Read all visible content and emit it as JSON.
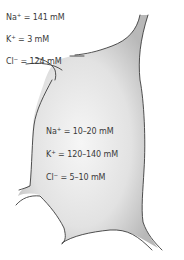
{
  "figure": {
    "extracellular": [
      {
        "ion": "Na",
        "charge": "+",
        "value": " = 141 mM"
      },
      {
        "ion": "K",
        "charge": "+",
        "value": " = 3 mM"
      },
      {
        "ion": "Cl",
        "charge": "−",
        "value": " = 124 mM"
      }
    ],
    "intracellular": [
      {
        "ion": "Na",
        "charge": "+",
        "value": " = 10–20 mM"
      },
      {
        "ion": "K",
        "charge": "+",
        "value": " = 120–140 mM"
      },
      {
        "ion": "Cl",
        "charge": "−",
        "value": " = 5–10 mM"
      }
    ],
    "colors": {
      "cell_fill_center": "#f4f4f4",
      "cell_fill_edge": "#bdbdbd",
      "outline": "#3c3c3c",
      "text": "#3a3a3a"
    }
  }
}
